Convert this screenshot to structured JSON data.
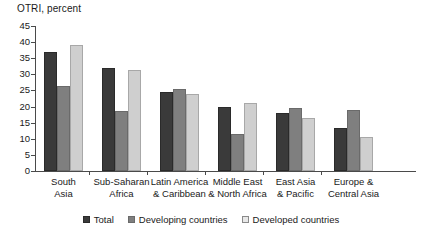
{
  "chart_data": {
    "type": "bar",
    "title": "OTRI, percent",
    "xlabel": "",
    "ylabel": "",
    "ylim": [
      0,
      45
    ],
    "yticks": [
      45,
      40,
      35,
      30,
      25,
      20,
      15,
      10,
      5,
      0
    ],
    "grid": false,
    "legend_position": "bottom",
    "categories": [
      "South\nAsia",
      "Sub-Saharan\nAfrica",
      "Latin America\n& Caribbean",
      "Middle East\n& North Africa",
      "East Asia\n& Pacific",
      "Europe &\nCentral Asia"
    ],
    "series": [
      {
        "name": "Total",
        "color": "#3a3a3a",
        "values": [
          37,
          32,
          24.5,
          20,
          18,
          13.5
        ]
      },
      {
        "name": "Developing countries",
        "color": "#7f7f7f",
        "values": [
          26.5,
          18.5,
          25.5,
          11.5,
          19.5,
          19
        ]
      },
      {
        "name": "Developed countries",
        "color": "#cfcfcf",
        "values": [
          39,
          31.5,
          24,
          21,
          16.5,
          10.5
        ]
      }
    ]
  }
}
